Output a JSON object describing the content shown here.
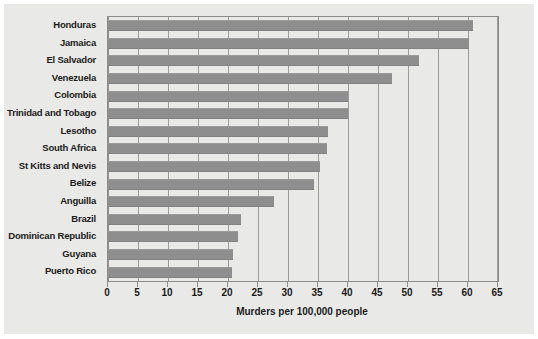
{
  "chart_data": {
    "type": "bar",
    "orientation": "horizontal",
    "title": "",
    "xlabel": "Murders per 100,000 people",
    "ylabel": "",
    "xlim": [
      0,
      65
    ],
    "xticks": [
      0,
      5,
      10,
      15,
      20,
      25,
      30,
      35,
      40,
      45,
      50,
      55,
      60,
      65
    ],
    "xtick_labels": [
      "0",
      "5",
      "10",
      "15",
      "20",
      "25",
      "30",
      "35",
      "40",
      "45",
      "50",
      "55",
      "60",
      "65"
    ],
    "grid": true,
    "grid_axis": "x",
    "legend": false,
    "categories": [
      "Honduras",
      "Jamaica",
      "El Salvador",
      "Venezuela",
      "Colombia",
      "Trinidad and Tobago",
      "Lesotho",
      "South Africa",
      "St Kitts and Nevis",
      "Belize",
      "Anguilla",
      "Brazil",
      "Dominican Republic",
      "Guyana",
      "Puerto Rico"
    ],
    "values": [
      60.8,
      60.2,
      51.8,
      47.3,
      40.0,
      40.0,
      36.6,
      36.5,
      35.3,
      34.3,
      27.7,
      22.1,
      21.6,
      20.8,
      20.6
    ],
    "colors": {
      "bar_fill": "#8e8e8e",
      "panel_background": "#e9e9e7",
      "gridline": "#9a9a98",
      "axis": "#8d8d8d",
      "text": "#1b1b1b"
    }
  }
}
